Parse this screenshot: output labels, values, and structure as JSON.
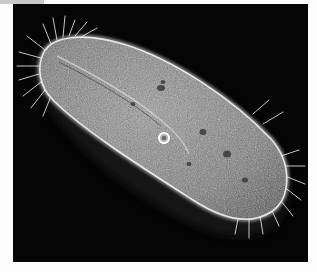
{
  "image": {
    "subject": "paramecium",
    "description": "Phase-contrast micrograph of a ciliated protozoan on a dark background",
    "colors": {
      "background": "#050505",
      "border": "#fdfdfd",
      "top_strip": "#c9c9c9",
      "body_fill": "#8a8a8a",
      "body_edge": "#f2f2f2",
      "cilia": "#e8e8e8"
    }
  }
}
